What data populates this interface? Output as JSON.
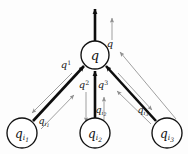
{
  "figure": {
    "background_color": "#fdfdfd",
    "thick_edge_color": "#0d0d0d",
    "thin_edge_color": "#8f8f8f",
    "node_fill_color": "#ffffff",
    "node_stroke_color": "#111111"
  },
  "nodes": [
    {
      "id": "center",
      "base": "q",
      "sub": "",
      "subsub": "",
      "cx": 95,
      "cy": 55,
      "r": 14
    },
    {
      "id": "child1",
      "base": "q",
      "sub": "i",
      "subsub": "1",
      "cx": 22,
      "cy": 133,
      "r": 15
    },
    {
      "id": "child2",
      "base": "q",
      "sub": "i",
      "subsub": "2",
      "cx": 95,
      "cy": 133,
      "r": 15
    },
    {
      "id": "child3",
      "base": "q",
      "sub": "i",
      "subsub": "3",
      "cx": 167,
      "cy": 133,
      "r": 15
    }
  ],
  "out_labels": [
    {
      "id": "out-top",
      "base": "q",
      "sup": "",
      "x": 110,
      "y": 47
    },
    {
      "id": "out-1",
      "base": "q",
      "sup": "1",
      "x": 66,
      "y": 68
    },
    {
      "id": "out-2",
      "base": "q",
      "sup": "2",
      "x": 84,
      "y": 88
    },
    {
      "id": "out-3",
      "base": "q",
      "sup": "3",
      "x": 103,
      "y": 88
    }
  ],
  "in_labels": [
    {
      "id": "in-1",
      "base": "q",
      "sub": "i",
      "subsub": "1",
      "x": 44,
      "y": 124
    },
    {
      "id": "in-2",
      "base": "q",
      "sub": "i",
      "subsub": "2",
      "x": 101,
      "y": 113
    },
    {
      "id": "in-3",
      "base": "q",
      "sub": "i",
      "subsub": "3",
      "x": 143,
      "y": 113
    }
  ]
}
